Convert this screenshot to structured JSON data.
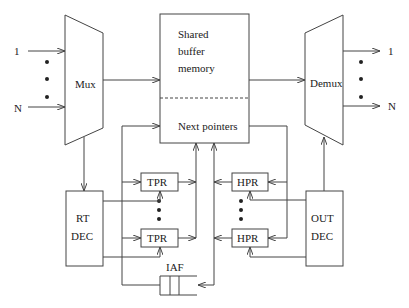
{
  "diagram": {
    "type": "shared-buffer switch architecture",
    "inputs": {
      "first": "1",
      "last": "N"
    },
    "outputs": {
      "first": "1",
      "last": "N"
    },
    "blocks": {
      "mux": "Mux",
      "demux": "Demux",
      "buffer_line1": "Shared",
      "buffer_line2": "buffer",
      "buffer_line3": "memory",
      "next_pointers": "Next pointers",
      "rt_dec_line1": "RT",
      "rt_dec_line2": "DEC",
      "out_dec_line1": "OUT",
      "out_dec_line2": "DEC",
      "tpr_top": "TPR",
      "tpr_bottom": "TPR",
      "hpr_top": "HPR",
      "hpr_bottom": "HPR",
      "iaf": "IAF"
    },
    "colors": {
      "line": "#444444",
      "text": "#222222",
      "background": "#ffffff"
    }
  }
}
